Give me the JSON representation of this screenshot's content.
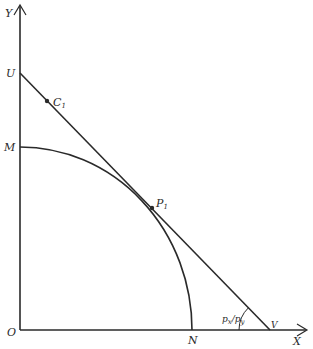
{
  "axes": {
    "x_label": "X",
    "y_label": "Y",
    "origin_label": "O"
  },
  "points": {
    "U": "U",
    "M": "M",
    "N": "N",
    "V": "V",
    "C1": "C",
    "C1_sub": "1",
    "P1": "P",
    "P1_sub": "1"
  },
  "angle_label": {
    "num": "p",
    "num_sub": "x",
    "slash": "/",
    "den": "p",
    "den_sub": "y"
  },
  "colors": {
    "ink": "#2a2a2a",
    "background": "#ffffff"
  }
}
